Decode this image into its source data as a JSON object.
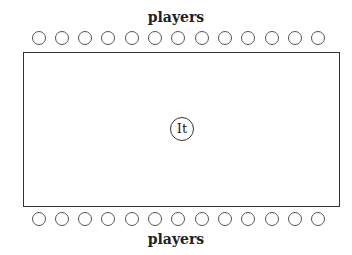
{
  "diagram": {
    "top_label": "players",
    "bottom_label": "players",
    "center_label": "It",
    "top_row_count": 13,
    "bottom_row_count": 13
  }
}
